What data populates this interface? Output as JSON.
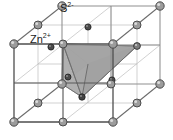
{
  "figure": {
    "name": "zinc-blende-unit-cell",
    "width": 173,
    "height": 140,
    "background": "#ffffff"
  },
  "labels": {
    "anion": {
      "text": "S",
      "charge": "2-",
      "full": "S2-",
      "x": 60,
      "y": 3
    },
    "cation": {
      "text": "Zn",
      "charge": "2+",
      "full": "Zn2+",
      "x": 30,
      "y": 34
    }
  },
  "colors": {
    "edge_front": "#5a5a5a",
    "edge_back": "#9a9a9a",
    "edge_internal": "#b9b9b9",
    "sphere_anion_fill": "#9e9e9e",
    "sphere_anion_edge": "#4a4a4a",
    "sphere_anion_highlight": "#d8d8d8",
    "sphere_cation_fill": "#4e4e4e",
    "sphere_cation_edge": "#262626",
    "tetra_top_face": "#b3b3b3",
    "tetra_right_face": "#8e8e8e",
    "tetra_left_face": "#c6c6c6",
    "tetra_edge": "#6f6f6f",
    "text": "#1b1b1b"
  },
  "geometry": {
    "cube_projection": "oblique",
    "front_face": {
      "top_left": [
        14,
        44
      ],
      "top_right": [
        113,
        44
      ],
      "bottom_right": [
        113,
        122
      ],
      "bottom_left": [
        14,
        122
      ]
    },
    "back_face": {
      "top_left": [
        62,
        6
      ],
      "top_right": [
        160,
        6
      ],
      "bottom_right": [
        160,
        84
      ],
      "bottom_left": [
        62,
        84
      ]
    },
    "mid_planes": true
  },
  "atoms": {
    "anion_label": "S2-",
    "cation_label": "Zn2+",
    "anion_radius": 4.2,
    "cation_radius": 3.4,
    "anion_positions": [
      [
        14,
        44
      ],
      [
        113,
        44
      ],
      [
        113,
        122
      ],
      [
        14,
        122
      ],
      [
        62,
        6
      ],
      [
        160,
        6
      ],
      [
        160,
        84
      ],
      [
        62,
        84
      ],
      [
        63,
        44
      ],
      [
        38,
        25
      ],
      [
        137,
        25
      ],
      [
        63,
        122
      ],
      [
        111,
        84
      ],
      [
        38,
        103
      ],
      [
        137,
        103
      ],
      [
        88,
        64
      ]
    ],
    "cation_positions": [
      [
        51,
        47
      ],
      [
        88,
        27
      ],
      [
        63,
        83
      ],
      [
        100,
        63
      ],
      [
        75,
        99
      ],
      [
        112,
        79
      ]
    ]
  },
  "tetrahedron": {
    "description": "coordination tetrahedron of one Zn2+ with four S2- neighbours",
    "apex_bottom": [
      82,
      97
    ],
    "vertex_a": [
      63,
      44
    ],
    "vertex_b": [
      137,
      46
    ],
    "vertex_c": [
      62,
      84
    ],
    "center_cation": [
      88,
      64
    ]
  }
}
